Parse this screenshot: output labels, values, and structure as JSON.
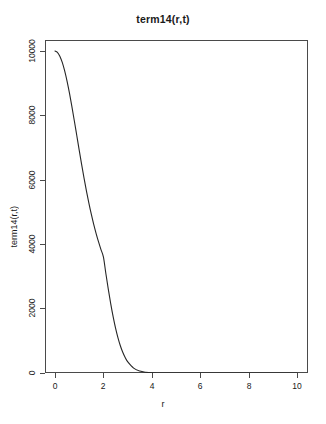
{
  "chart_data": {
    "type": "line",
    "title": "term14(r,t)",
    "xlabel": "r",
    "ylabel": "term14(r,t)",
    "xlim": [
      0,
      10
    ],
    "ylim": [
      0,
      10000
    ],
    "grid": false,
    "legend": null,
    "xticks": [
      {
        "value": 0,
        "label": "0"
      },
      {
        "value": 2,
        "label": "2"
      },
      {
        "value": 4,
        "label": "4"
      },
      {
        "value": 6,
        "label": "6"
      },
      {
        "value": 8,
        "label": "8"
      },
      {
        "value": 10,
        "label": "10"
      }
    ],
    "yticks": [
      {
        "value": 0,
        "label": "0"
      },
      {
        "value": 2000,
        "label": "2000"
      },
      {
        "value": 4000,
        "label": "4000"
      },
      {
        "value": 6000,
        "label": "6000"
      },
      {
        "value": 8000,
        "label": "8000"
      },
      {
        "value": 10000,
        "label": "10000"
      }
    ],
    "series": [
      {
        "name": "term14(r,t)",
        "color": "#262626",
        "x": [
          0.0,
          0.1,
          0.2,
          0.3,
          0.4,
          0.5,
          0.6,
          0.7,
          0.8,
          0.9,
          1.0,
          1.1,
          1.2,
          1.3,
          1.4,
          1.5,
          1.6,
          1.7,
          1.8,
          1.9,
          2.0,
          2.1,
          2.2,
          2.3,
          2.4,
          2.5,
          2.6,
          2.7,
          2.8,
          2.9,
          3.0,
          3.25,
          3.5,
          3.75,
          4.0,
          4.5,
          5.0,
          5.5,
          6.0,
          6.5,
          7.0,
          7.5,
          8.0,
          8.5,
          9.0,
          9.5,
          10.0
        ],
        "y": [
          10000,
          9960,
          9840,
          9646,
          9382,
          9057,
          8681,
          8266,
          7827,
          7375,
          6922,
          6479,
          6053,
          5651,
          5276,
          4931,
          4616,
          4330,
          4070,
          3830,
          3606,
          3099,
          2614,
          2163,
          1757,
          1401,
          1098,
          846,
          642,
          479,
          352,
          150,
          60,
          23,
          8,
          1.0,
          0.1,
          0.01,
          0,
          0,
          0,
          0,
          0,
          0,
          0,
          0,
          0
        ]
      }
    ]
  },
  "axis": {
    "title": "term14(r,t)",
    "x_title": "r",
    "y_title": "term14(r,t)"
  }
}
